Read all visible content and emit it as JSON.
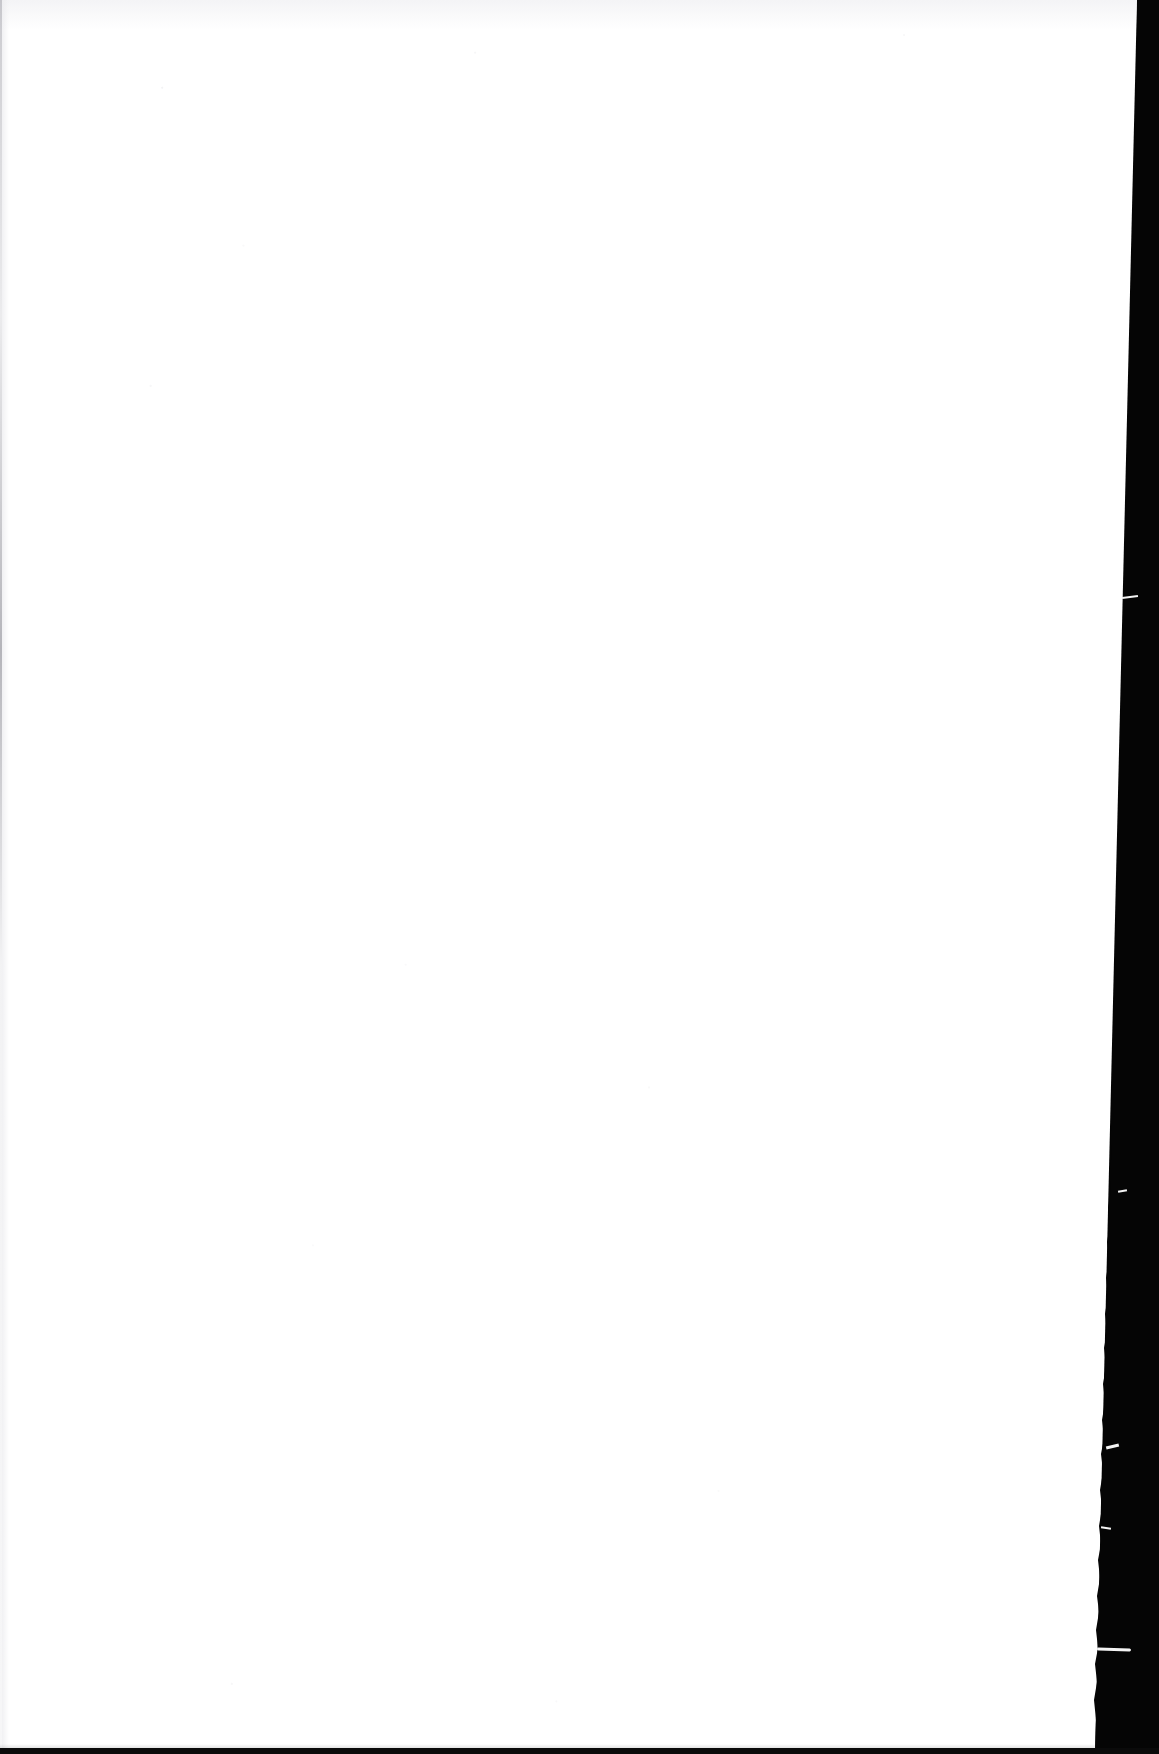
{
  "document": {
    "kind": "scanned-page",
    "page_state": "blank",
    "visible_text": "",
    "page_number": "",
    "caption": ""
  },
  "scan": {
    "width_px": 1159,
    "height_px": 1754,
    "paper_color": "#ffffff",
    "backdrop_color": "#050505",
    "bottom_rule_color": "#0a0a0a",
    "gutter_line_color": "#a0a0a8",
    "fiber_color": "#f4f4f4"
  },
  "page_edge": {
    "side": "right",
    "top_x_px": 1137,
    "bottom_x_px": 1095,
    "texture": "ragged-torn-fibrous"
  },
  "regions": [
    {
      "name": "paper-field",
      "label": ""
    },
    {
      "name": "scanner-backdrop",
      "label": ""
    },
    {
      "name": "bottom-rule",
      "label": ""
    },
    {
      "name": "left-gutter-line",
      "label": ""
    }
  ]
}
